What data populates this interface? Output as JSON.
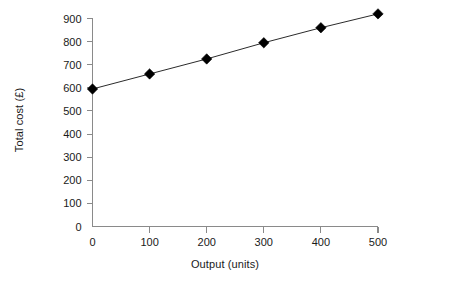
{
  "chart_data": {
    "type": "line",
    "title": "",
    "subtitle": "",
    "xlabel": "Output (units)",
    "ylabel": "Total cost (£)",
    "x": [
      0,
      100,
      200,
      300,
      400,
      500
    ],
    "values": [
      595,
      660,
      725,
      795,
      860,
      920
    ],
    "series": [
      {
        "name": "Total cost",
        "x": [
          0,
          100,
          200,
          300,
          400,
          500
        ],
        "values": [
          595,
          660,
          725,
          795,
          860,
          920
        ],
        "marker": "filled-diamond",
        "marker_color": "#000000",
        "line_color": "#2b2b2b"
      }
    ],
    "xlim": [
      0,
      500
    ],
    "ylim": [
      0,
      900
    ],
    "x_ticks": [
      0,
      100,
      200,
      300,
      400,
      500
    ],
    "y_ticks": [
      0,
      100,
      200,
      300,
      400,
      500,
      600,
      700,
      800,
      900
    ],
    "x_tick_labels": [
      "0",
      "100",
      "200",
      "300",
      "400",
      "500"
    ],
    "y_tick_labels": [
      "0",
      "100",
      "200",
      "300",
      "400",
      "500",
      "600",
      "700",
      "800",
      "900"
    ],
    "grid": false,
    "legend": false,
    "legend_position": "none",
    "annotations": [],
    "background_color": "#ffffff",
    "axis_color": "#8a8a8a",
    "text_color": "#1a1a1a"
  }
}
